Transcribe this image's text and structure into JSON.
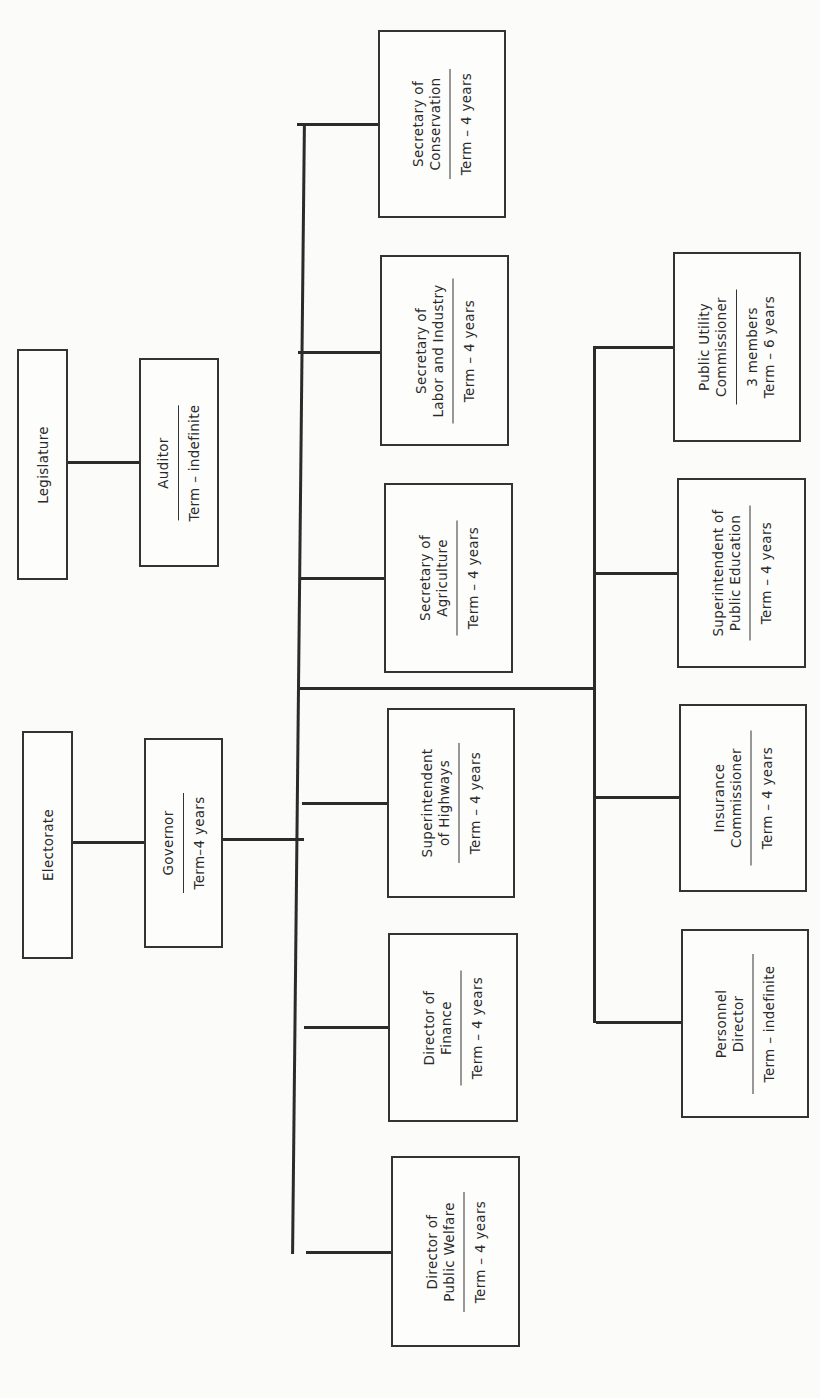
{
  "nodes": {
    "legislature": {
      "title": [
        "Legislature"
      ]
    },
    "auditor": {
      "title": [
        "Auditor"
      ],
      "term": [
        "Term – indefinite"
      ]
    },
    "electorate": {
      "title": [
        "Electorate"
      ]
    },
    "governor": {
      "title": [
        "Governor"
      ],
      "term": [
        "Term–4 years"
      ]
    },
    "conservation": {
      "title": [
        "Secretary of",
        "Conservation"
      ],
      "term": [
        "Term – 4 years"
      ]
    },
    "labor": {
      "title": [
        "Secretary of",
        "Labor and Industry"
      ],
      "term": [
        "Term – 4 years"
      ]
    },
    "agriculture": {
      "title": [
        "Secretary of",
        "Agriculture"
      ],
      "term": [
        "Term – 4 years"
      ]
    },
    "highways": {
      "title": [
        "Superintendent",
        "of Highways"
      ],
      "term": [
        "Term – 4 years"
      ]
    },
    "finance": {
      "title": [
        "Director of",
        "Finance"
      ],
      "term": [
        "Term – 4 years"
      ]
    },
    "welfare": {
      "title": [
        "Director of",
        "Public Welfare"
      ],
      "term": [
        "Term – 4 years"
      ]
    },
    "public_utility": {
      "title": [
        "Public Utility",
        "Commissioner"
      ],
      "term": [
        "3 members",
        "Term – 6 years"
      ]
    },
    "education": {
      "title": [
        "Superintendent of",
        "Public Education"
      ],
      "term": [
        "Term – 4 years"
      ]
    },
    "insurance": {
      "title": [
        "Insurance",
        "Commissioner"
      ],
      "term": [
        "Term – 4 years"
      ]
    },
    "personnel": {
      "title": [
        "Personnel",
        "Director"
      ],
      "term": [
        "Term – indefinite"
      ]
    }
  },
  "edges": [
    [
      "legislature",
      "auditor"
    ],
    [
      "electorate",
      "governor"
    ],
    [
      "governor",
      "conservation"
    ],
    [
      "governor",
      "labor"
    ],
    [
      "governor",
      "agriculture"
    ],
    [
      "governor",
      "highways"
    ],
    [
      "governor",
      "finance"
    ],
    [
      "governor",
      "welfare"
    ],
    [
      "governor",
      "public_utility"
    ],
    [
      "governor",
      "education"
    ],
    [
      "governor",
      "insurance"
    ],
    [
      "governor",
      "personnel"
    ]
  ],
  "colors": {
    "line": "#2b2b2b",
    "background": "#fbfbf9"
  }
}
